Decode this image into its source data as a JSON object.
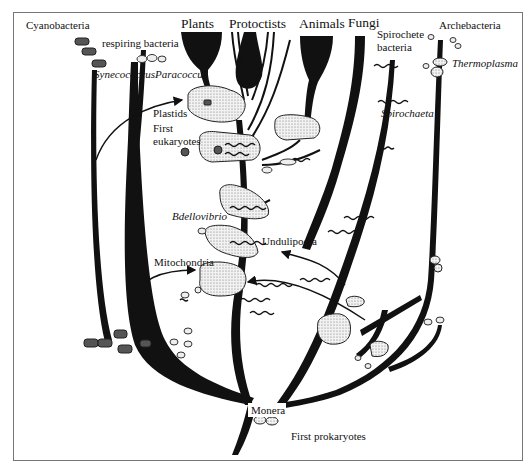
{
  "diagram": {
    "type": "phylogenetic-tree",
    "kingdoms": {
      "plants": "Plants",
      "protoctists": "Protoctists",
      "animals": "Animals",
      "fungi": "Fungi"
    },
    "lineages": {
      "cyanobacteria": "Cyanobacteria",
      "respiring_bacteria": "respiring bacteria",
      "synechococcus": "Synecococcus",
      "paracoccus": "Paracoccus",
      "spirochete_bacteria": "Spirochete bacteria",
      "spirochete_line1": "Spirochete",
      "spirochete_line2": "bacteria",
      "spirochaeta": "Spirochaeta",
      "archebacteria": "Archebacteria",
      "thermoplasma": "Thermoplasma",
      "bdellovibrio": "Bdellovibrio"
    },
    "events": {
      "plastids": "Plastids",
      "first_eukaryotes_line1": "First",
      "first_eukaryotes_line2": "eukaryotes",
      "undulipodia": "Undulipodia",
      "mitochondria": "Mitochondria"
    },
    "root": {
      "monera": "Monera",
      "first_prokaryotes": "First prokaryotes"
    },
    "colors": {
      "branch": "#111111",
      "cell_fill": "#d8d8d8",
      "frame": "#777777",
      "background": "#ffffff"
    }
  }
}
